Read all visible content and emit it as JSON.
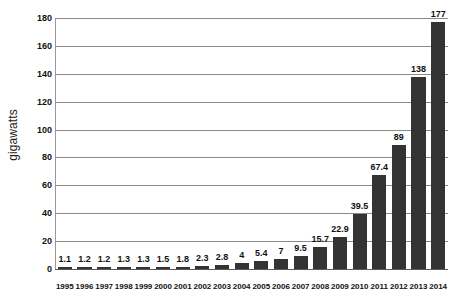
{
  "chart_data": {
    "type": "bar",
    "title": "",
    "subtitle": "",
    "xlabel": "",
    "ylabel": "gigawatts",
    "categories": [
      "1995",
      "1996",
      "1997",
      "1998",
      "1999",
      "2000",
      "2001",
      "2002",
      "2003",
      "2004",
      "2005",
      "2006",
      "2007",
      "2008",
      "2009",
      "2010",
      "2011",
      "2012",
      "2013",
      "2014"
    ],
    "values": [
      1.1,
      1.2,
      1.2,
      1.3,
      1.3,
      1.5,
      1.8,
      2.3,
      2.8,
      4,
      5.4,
      7,
      9.5,
      15.7,
      22.9,
      39.5,
      67.4,
      89,
      138,
      177
    ],
    "value_labels": [
      "1.1",
      "1.2",
      "1.2",
      "1.3",
      "1.3",
      "1.5",
      "1.8",
      "2.3",
      "2.8",
      "4",
      "5.4",
      "7",
      "9.5",
      "15.7",
      "22.9",
      "39.5",
      "67.4",
      "89",
      "138",
      "177"
    ],
    "ylim": [
      0,
      180
    ],
    "y_ticks": [
      0,
      20,
      40,
      60,
      80,
      100,
      120,
      140,
      160,
      180
    ],
    "y_tick_labels": [
      "0",
      "20",
      "40",
      "60",
      "80",
      "100",
      "120",
      "140",
      "160",
      "180"
    ],
    "grid": true,
    "legend": null,
    "legend_position": "none",
    "annotations": []
  },
  "style": {
    "bar_color": "#333333",
    "gridline_color": "#8a8a8a",
    "background_color": "#ffffff",
    "text_color": "#111111"
  }
}
